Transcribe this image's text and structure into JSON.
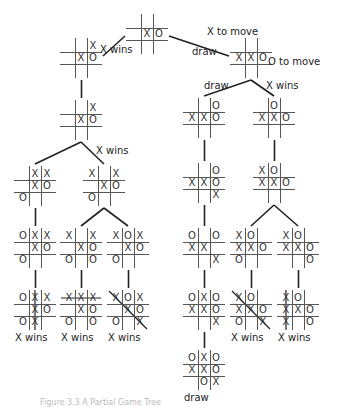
{
  "diagram": {
    "caption": "Figure 3.3  A Partial Game Tree",
    "annotations": [
      {
        "id": "x-to-move",
        "text": "X to move",
        "x": 207,
        "y": 26
      },
      {
        "id": "o-to-move",
        "text": "O to move",
        "x": 268,
        "y": 56
      }
    ],
    "nodes": [
      {
        "id": "root",
        "x": 129,
        "y": 16,
        "cells": [
          "",
          "",
          "",
          "",
          "X",
          "O",
          "",
          "",
          ""
        ]
      },
      {
        "id": "L1",
        "x": 63,
        "y": 40,
        "cells": [
          "",
          "",
          "X",
          "",
          "X",
          "O",
          "",
          "",
          ""
        ]
      },
      {
        "id": "R1",
        "x": 233,
        "y": 40,
        "cells": [
          "",
          "",
          "",
          "X",
          "X",
          "O",
          "",
          "",
          ""
        ]
      },
      {
        "id": "L2",
        "x": 63,
        "y": 102,
        "cells": [
          "",
          "",
          "X",
          "",
          "X",
          "O",
          "",
          "",
          ""
        ]
      },
      {
        "id": "L3a",
        "x": 17,
        "y": 168,
        "cells": [
          "",
          "X",
          "X",
          "",
          "X",
          "O",
          "O",
          "",
          ""
        ]
      },
      {
        "id": "L3b",
        "x": 86,
        "y": 168,
        "cells": [
          "X",
          "",
          "X",
          "",
          "X",
          "O",
          "O",
          "",
          ""
        ]
      },
      {
        "id": "R2a",
        "x": 186,
        "y": 100,
        "cells": [
          "",
          "",
          "O",
          "X",
          "X",
          "O",
          "",
          "",
          ""
        ]
      },
      {
        "id": "R2b",
        "x": 256,
        "y": 100,
        "cells": [
          "",
          "O",
          "",
          "X",
          "X",
          "O",
          "",
          "",
          ""
        ]
      },
      {
        "id": "R3a",
        "x": 186,
        "y": 165,
        "cells": [
          "",
          "",
          "O",
          "X",
          "X",
          "O",
          "",
          "",
          "X"
        ]
      },
      {
        "id": "R3b",
        "x": 256,
        "y": 165,
        "cells": [
          "X",
          "O",
          "",
          "X",
          "X",
          "O",
          "",
          "",
          ""
        ]
      },
      {
        "id": "L4a",
        "x": 17,
        "y": 230,
        "cells": [
          "O",
          "X",
          "X",
          "",
          "X",
          "O",
          "O",
          "",
          ""
        ]
      },
      {
        "id": "L4b",
        "x": 63,
        "y": 230,
        "cells": [
          "X",
          "",
          "X",
          "",
          "X",
          "O",
          "O",
          "",
          "O"
        ]
      },
      {
        "id": "L4c",
        "x": 110,
        "y": 230,
        "cells": [
          "X",
          "O",
          "X",
          "",
          "X",
          "O",
          "O",
          "",
          ""
        ]
      },
      {
        "id": "R4a",
        "x": 186,
        "y": 230,
        "cells": [
          "O",
          "",
          "O",
          "X",
          "X",
          "",
          "",
          "",
          "X"
        ]
      },
      {
        "id": "R4b",
        "x": 233,
        "y": 230,
        "cells": [
          "X",
          "O",
          "",
          "X",
          "X",
          "O",
          "O",
          "",
          ""
        ]
      },
      {
        "id": "R4c",
        "x": 280,
        "y": 230,
        "cells": [
          "X",
          "O",
          "",
          "X",
          "X",
          "O",
          "",
          "",
          "O"
        ]
      },
      {
        "id": "L5a",
        "x": 17,
        "y": 292,
        "cells": [
          "O",
          "X",
          "X",
          "",
          "X",
          "O",
          "O",
          "X",
          ""
        ],
        "result": "X wins",
        "strike": "col1"
      },
      {
        "id": "L5b",
        "x": 63,
        "y": 292,
        "cells": [
          "X",
          "X",
          "X",
          "",
          "X",
          "O",
          "O",
          "",
          "O"
        ],
        "result": "X wins",
        "strike": "row0"
      },
      {
        "id": "L5c",
        "x": 110,
        "y": 292,
        "cells": [
          "X",
          "O",
          "X",
          "",
          "X",
          "O",
          "O",
          "",
          "X"
        ],
        "result": "X wins",
        "strike": "diag"
      },
      {
        "id": "R5a",
        "x": 186,
        "y": 292,
        "cells": [
          "O",
          "X",
          "O",
          "X",
          "X",
          "O",
          "",
          "",
          "X"
        ]
      },
      {
        "id": "R5b",
        "x": 233,
        "y": 292,
        "cells": [
          "X",
          "O",
          "",
          "X",
          "X",
          "O",
          "O",
          "",
          "X"
        ],
        "result": "X wins",
        "strike": "diag"
      },
      {
        "id": "R5c",
        "x": 280,
        "y": 292,
        "cells": [
          "X",
          "O",
          "",
          "X",
          "X",
          "O",
          "X",
          "",
          "O"
        ],
        "result": "X wins",
        "strike": "col0"
      },
      {
        "id": "R6",
        "x": 186,
        "y": 352,
        "cells": [
          "O",
          "X",
          "O",
          "X",
          "X",
          "O",
          "",
          "O",
          "X"
        ],
        "result": "draw"
      }
    ],
    "edges": [
      {
        "from": "root",
        "to": "L1",
        "label": "X wins",
        "lx": 100,
        "ly": 44
      },
      {
        "from": "root",
        "to": "R1",
        "label": "draw",
        "lx": 192,
        "ly": 46
      },
      {
        "from": "L1",
        "to": "L2",
        "label": ""
      },
      {
        "from": "R1",
        "to": "R2a",
        "label": "draw",
        "lx": 204,
        "ly": 80
      },
      {
        "from": "R1",
        "to": "R2b",
        "label": "X wins",
        "lx": 266,
        "ly": 80
      },
      {
        "from": "L2",
        "to": "L3a",
        "label": ""
      },
      {
        "from": "L2",
        "to": "L3b",
        "label": "X wins",
        "lx": 96,
        "ly": 145
      },
      {
        "from": "R2a",
        "to": "R3a",
        "label": ""
      },
      {
        "from": "R2b",
        "to": "R3b",
        "label": ""
      },
      {
        "from": "L3a",
        "to": "L4a",
        "label": ""
      },
      {
        "from": "L3b",
        "to": "L4b",
        "label": ""
      },
      {
        "from": "L3b",
        "to": "L4c",
        "label": ""
      },
      {
        "from": "R3a",
        "to": "R4a",
        "label": ""
      },
      {
        "from": "R3b",
        "to": "R4b",
        "label": ""
      },
      {
        "from": "R3b",
        "to": "R4c",
        "label": ""
      },
      {
        "from": "L4a",
        "to": "L5a",
        "label": ""
      },
      {
        "from": "L4b",
        "to": "L5b",
        "label": ""
      },
      {
        "from": "L4c",
        "to": "L5c",
        "label": ""
      },
      {
        "from": "R4a",
        "to": "R5a",
        "label": ""
      },
      {
        "from": "R4b",
        "to": "R5b",
        "label": ""
      },
      {
        "from": "R4c",
        "to": "R5c",
        "label": ""
      },
      {
        "from": "R5a",
        "to": "R6",
        "label": ""
      }
    ]
  }
}
